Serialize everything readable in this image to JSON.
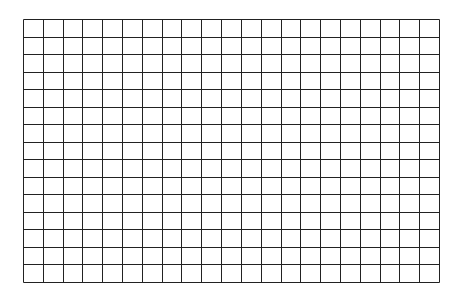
{
  "grid": {
    "columns": 21,
    "rows": 15,
    "left": 23,
    "top": 19,
    "width": 416,
    "height": 263,
    "line_color": "#222222",
    "background": "#ffffff"
  }
}
